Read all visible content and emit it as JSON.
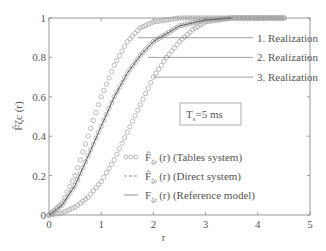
{
  "chart_data": {
    "type": "line",
    "title": "",
    "xlabel": "r",
    "ylabel": "F̂ζc (r)",
    "xlim": [
      0,
      5
    ],
    "ylim": [
      0,
      1
    ],
    "xticks": [
      "0",
      "1",
      "2",
      "3",
      "4",
      "5"
    ],
    "yticks": [
      "0",
      "0.2",
      "0.4",
      "0.6",
      "0.8",
      "1"
    ],
    "grid": false,
    "legend_position": "lower right inside",
    "legend": [
      {
        "marker": "ooo",
        "label_main": "F̂",
        "label_sub": "ζc",
        "label_rest": "(r) (Tables system)"
      },
      {
        "marker": "---",
        "label_main": "F̂",
        "label_sub": "ζc",
        "label_rest": "(r) (Direct system)"
      },
      {
        "marker": "—",
        "label_main": "F",
        "label_sub": "ζc",
        "label_rest": "(r) (Reference model)"
      }
    ],
    "annotations": [
      {
        "text": "1. Realization",
        "x": 1.7,
        "y": 0.9
      },
      {
        "text": "2. Realization",
        "x": 1.9,
        "y": 0.8
      },
      {
        "text": "3. Realization",
        "x": 2.0,
        "y": 0.7
      },
      {
        "text": "Ts=5 ms",
        "main": "T",
        "sub": "s",
        "rest": "=5 ms"
      }
    ],
    "series": [
      {
        "name": "Realization 1 (Tables system)",
        "style": "circles",
        "x": [
          0,
          0.25,
          0.5,
          0.75,
          1.0,
          1.25,
          1.5,
          1.75,
          2.0,
          2.5,
          3.0,
          3.5,
          4.0,
          4.5
        ],
        "y": [
          0,
          0.06,
          0.2,
          0.4,
          0.6,
          0.76,
          0.88,
          0.95,
          0.98,
          1.0,
          1.0,
          1.0,
          1.0,
          1.0
        ]
      },
      {
        "name": "Realization 2 (Tables system)",
        "style": "circles",
        "x": [
          0,
          0.25,
          0.5,
          0.75,
          1.0,
          1.25,
          1.5,
          1.75,
          2.0,
          2.5,
          3.0,
          3.5,
          4.0,
          4.5
        ],
        "y": [
          0,
          0.05,
          0.15,
          0.3,
          0.45,
          0.6,
          0.72,
          0.81,
          0.88,
          0.96,
          0.99,
          1.0,
          1.0,
          1.0
        ]
      },
      {
        "name": "Realization 3 (Tables system)",
        "style": "circles",
        "x": [
          0,
          0.25,
          0.5,
          0.75,
          1.0,
          1.25,
          1.5,
          1.75,
          2.0,
          2.25,
          2.5,
          2.75,
          3.0,
          3.5,
          4.0,
          4.5
        ],
        "y": [
          0,
          0.01,
          0.04,
          0.09,
          0.17,
          0.28,
          0.42,
          0.56,
          0.7,
          0.8,
          0.88,
          0.94,
          0.98,
          1.0,
          1.0,
          1.0
        ]
      },
      {
        "name": "Direct system",
        "style": "dashed",
        "x": [
          0,
          0.25,
          0.5,
          0.75,
          1.0,
          1.25,
          1.5,
          1.75,
          2.0,
          2.5,
          3.0,
          3.5
        ],
        "y": [
          0,
          0.05,
          0.15,
          0.3,
          0.45,
          0.6,
          0.72,
          0.81,
          0.88,
          0.96,
          0.99,
          1.0
        ]
      },
      {
        "name": "Reference model",
        "style": "solid",
        "x": [
          0,
          0.25,
          0.5,
          0.75,
          1.0,
          1.25,
          1.5,
          1.75,
          2.0,
          2.5,
          3.0,
          3.5
        ],
        "y": [
          0,
          0.05,
          0.15,
          0.3,
          0.45,
          0.6,
          0.72,
          0.81,
          0.88,
          0.96,
          0.99,
          1.0
        ]
      }
    ]
  }
}
